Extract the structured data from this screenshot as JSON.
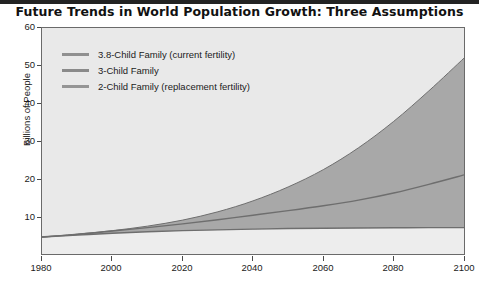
{
  "chart_data": {
    "type": "area",
    "title": "Future Trends in World Population Growth: Three Assumptions",
    "xlabel": "",
    "ylabel": "Billions of People",
    "xlim": [
      1980,
      2100
    ],
    "ylim": [
      0,
      60
    ],
    "xticks": [
      1980,
      2000,
      2020,
      2040,
      2060,
      2080,
      2100
    ],
    "yticks": [
      10,
      20,
      30,
      40,
      50,
      60
    ],
    "grid": false,
    "legend_position": "upper-left-inside",
    "x": [
      1980,
      1990,
      2000,
      2010,
      2020,
      2030,
      2040,
      2050,
      2060,
      2070,
      2080,
      2090,
      2100
    ],
    "series": [
      {
        "name": "3.8-Child Family (current fertility)",
        "values": [
          4.5,
          5.3,
          6.2,
          7.4,
          9.0,
          11.2,
          14.1,
          17.8,
          22.4,
          28.2,
          35.2,
          43.3,
          52.0
        ]
      },
      {
        "name": "3-Child Family",
        "values": [
          4.5,
          5.2,
          6.1,
          7.0,
          8.0,
          9.1,
          10.3,
          11.5,
          12.8,
          14.3,
          16.2,
          18.5,
          21.0
        ]
      },
      {
        "name": "2-Child Family (replacement fertility)",
        "values": [
          4.5,
          5.0,
          5.5,
          5.9,
          6.2,
          6.4,
          6.6,
          6.75,
          6.85,
          6.9,
          6.95,
          7.0,
          7.0
        ]
      }
    ]
  },
  "legend": {
    "items": [
      {
        "label": "3.8-Child Family (current fertility)",
        "color": "#909090"
      },
      {
        "label": "3-Child Family",
        "color": "#8a8a8a"
      },
      {
        "label": "2-Child Family (replacement fertility)",
        "color": "#959595"
      }
    ]
  },
  "axes": {
    "y_title": "Billions of People",
    "y_ticks": [
      "60",
      "50",
      "40",
      "30",
      "20",
      "10"
    ],
    "x_ticks": [
      "1980",
      "2000",
      "2020",
      "2040",
      "2060",
      "2080",
      "2100"
    ]
  },
  "colors": {
    "plot_background": "#e9e9e9",
    "band_fill": "#a8a8a8",
    "lower_band_fill": "#ededed",
    "line": "#6e6e6e",
    "frame": "#6a6a6a",
    "top_rule": "#232323",
    "text": "#1b1b1b"
  }
}
